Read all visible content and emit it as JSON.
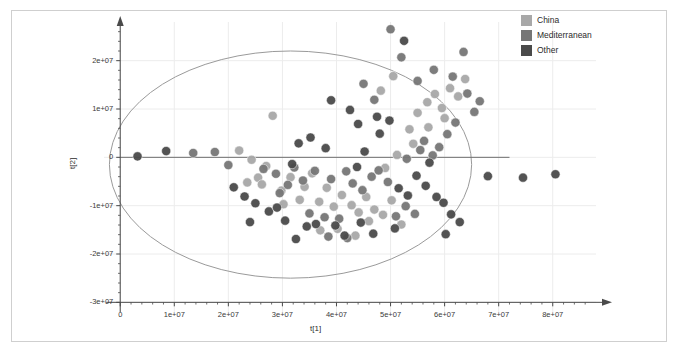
{
  "chart_data": {
    "type": "scatter",
    "title": "",
    "xlabel": "t[1]",
    "ylabel": "t[2]",
    "xlim": [
      -3000000,
      88000000
    ],
    "ylim": [
      -32000000,
      28000000
    ],
    "xticks": [
      0,
      10000000,
      20000000,
      30000000,
      40000000,
      50000000,
      60000000,
      70000000,
      80000000
    ],
    "xtick_labels": [
      "0",
      "1e+07",
      "2e+07",
      "3e+07",
      "4e+07",
      "5e+07",
      "6e+07",
      "7e+07",
      "8e+07"
    ],
    "yticks": [
      20000000,
      10000000,
      0,
      -10000000,
      -20000000,
      -30000000
    ],
    "ytick_labels": [
      "2e+07",
      "1e+07",
      "0",
      "-1e+07",
      "-2e+07",
      "-3e+07"
    ],
    "grid": true,
    "legend_position": "top-right",
    "confidence_ellipse": {
      "center_x": 31500000,
      "center_y": -1500000,
      "radius_x": 33500000,
      "radius_y": 23500000,
      "stroke": "#9a9a9a",
      "label": "hotelling-t2-ellipse"
    },
    "zero_line_y": 0,
    "series": [
      {
        "name": "China",
        "color": "#a8a8a8",
        "points": [
          [
            22000000,
            1400000
          ],
          [
            24300000,
            -500000
          ],
          [
            27000000,
            -1800000
          ],
          [
            28200000,
            8600000
          ],
          [
            25500000,
            -4200000
          ],
          [
            23500000,
            -5200000
          ],
          [
            26200000,
            -5600000
          ],
          [
            29800000,
            -6900000
          ],
          [
            31500000,
            -4100000
          ],
          [
            33200000,
            -8800000
          ],
          [
            30200000,
            -9700000
          ],
          [
            35500000,
            -3300000
          ],
          [
            34100000,
            -6100000
          ],
          [
            36800000,
            -9200000
          ],
          [
            38200000,
            -6300000
          ],
          [
            39500000,
            -10200000
          ],
          [
            41000000,
            -7800000
          ],
          [
            42800000,
            -9900000
          ],
          [
            44100000,
            -11400000
          ],
          [
            40200000,
            -14800000
          ],
          [
            37000000,
            -15100000
          ],
          [
            45500000,
            -8200000
          ],
          [
            47000000,
            -10800000
          ],
          [
            48600000,
            -11900000
          ],
          [
            50200000,
            -8900000
          ],
          [
            46000000,
            -13200000
          ],
          [
            52000000,
            -13900000
          ],
          [
            43500000,
            -16200000
          ],
          [
            49000000,
            -2200000
          ],
          [
            51200000,
            500000
          ],
          [
            53500000,
            5800000
          ],
          [
            55000000,
            9200000
          ],
          [
            56800000,
            11400000
          ],
          [
            58200000,
            13100000
          ],
          [
            59500000,
            10200000
          ],
          [
            61000000,
            14300000
          ],
          [
            62500000,
            12600000
          ],
          [
            57000000,
            6200000
          ],
          [
            54200000,
            2800000
          ],
          [
            60000000,
            8100000
          ],
          [
            63800000,
            16200000
          ],
          [
            50500000,
            16800000
          ],
          [
            48200000,
            13800000
          ]
        ]
      },
      {
        "name": "Mediterranean",
        "color": "#767676",
        "points": [
          [
            13500000,
            900000
          ],
          [
            17500000,
            1100000
          ],
          [
            20000000,
            -1600000
          ],
          [
            26500000,
            -2400000
          ],
          [
            28800000,
            -3400000
          ],
          [
            31000000,
            -5700000
          ],
          [
            29500000,
            -7400000
          ],
          [
            33800000,
            -4800000
          ],
          [
            32200000,
            -2100000
          ],
          [
            36000000,
            -2800000
          ],
          [
            35000000,
            -11600000
          ],
          [
            37800000,
            -12400000
          ],
          [
            39000000,
            -4500000
          ],
          [
            41800000,
            -2900000
          ],
          [
            43000000,
            -5400000
          ],
          [
            44800000,
            -6800000
          ],
          [
            46500000,
            -4000000
          ],
          [
            40500000,
            -12700000
          ],
          [
            38500000,
            -16400000
          ],
          [
            42000000,
            -16700000
          ],
          [
            47800000,
            -2700000
          ],
          [
            49500000,
            -5100000
          ],
          [
            51000000,
            -12200000
          ],
          [
            52800000,
            -10100000
          ],
          [
            54500000,
            -11700000
          ],
          [
            53000000,
            -300000
          ],
          [
            55500000,
            1500000
          ],
          [
            56200000,
            3400000
          ],
          [
            57800000,
            400000
          ],
          [
            59000000,
            2100000
          ],
          [
            60500000,
            4800000
          ],
          [
            62000000,
            7200000
          ],
          [
            58000000,
            18100000
          ],
          [
            55000000,
            15800000
          ],
          [
            52000000,
            20700000
          ],
          [
            47000000,
            11900000
          ],
          [
            45000000,
            15200000
          ],
          [
            50000000,
            26500000
          ],
          [
            63500000,
            21800000
          ],
          [
            65500000,
            9400000
          ],
          [
            64200000,
            13200000
          ],
          [
            66500000,
            11600000
          ],
          [
            61500000,
            16700000
          ]
        ]
      },
      {
        "name": "Other",
        "color": "#4a4a4a",
        "points": [
          [
            3200000,
            200000
          ],
          [
            8500000,
            1300000
          ],
          [
            21000000,
            -6200000
          ],
          [
            23000000,
            -8100000
          ],
          [
            25000000,
            -9500000
          ],
          [
            27500000,
            -11200000
          ],
          [
            24000000,
            -13400000
          ],
          [
            29000000,
            -10400000
          ],
          [
            30500000,
            -13100000
          ],
          [
            31800000,
            -1400000
          ],
          [
            33000000,
            2900000
          ],
          [
            34500000,
            -14300000
          ],
          [
            32500000,
            -16900000
          ],
          [
            36200000,
            -13800000
          ],
          [
            38000000,
            1900000
          ],
          [
            35200000,
            4100000
          ],
          [
            39800000,
            -14100000
          ],
          [
            41500000,
            -16200000
          ],
          [
            43800000,
            -2000000
          ],
          [
            45200000,
            1200000
          ],
          [
            44500000,
            -13500000
          ],
          [
            46800000,
            -15800000
          ],
          [
            48000000,
            4900000
          ],
          [
            49800000,
            7600000
          ],
          [
            51500000,
            -6400000
          ],
          [
            53200000,
            -7900000
          ],
          [
            50800000,
            -14700000
          ],
          [
            54800000,
            -3800000
          ],
          [
            56500000,
            -5900000
          ],
          [
            58500000,
            -8200000
          ],
          [
            57200000,
            -1100000
          ],
          [
            59800000,
            -9400000
          ],
          [
            61200000,
            -11800000
          ],
          [
            60200000,
            -15900000
          ],
          [
            52500000,
            24100000
          ],
          [
            62800000,
            -13400000
          ],
          [
            68000000,
            -3900000
          ],
          [
            74500000,
            -4200000
          ],
          [
            80500000,
            -3500000
          ],
          [
            42500000,
            9800000
          ],
          [
            44000000,
            6900000
          ],
          [
            39000000,
            11800000
          ],
          [
            47500000,
            8400000
          ]
        ]
      }
    ]
  },
  "legend": {
    "items": [
      {
        "label": "China",
        "color": "#a8a8a8"
      },
      {
        "label": "Mediterranean",
        "color": "#767676"
      },
      {
        "label": "Other",
        "color": "#4a4a4a"
      }
    ]
  },
  "axes": {
    "x_title": "t[1]",
    "y_title": "t[2]",
    "x_tick_labels": [
      "0",
      "1e+07",
      "2e+07",
      "3e+07",
      "4e+07",
      "5e+07",
      "6e+07",
      "7e+07",
      "8e+07"
    ],
    "y_tick_labels": [
      "2e+07",
      "1e+07",
      "0",
      "-1e+07",
      "-2e+07",
      "-3e+07"
    ]
  },
  "colors": {
    "frame": "#cfcfcf",
    "axis": "#4a4a4a",
    "grid": "#ececec",
    "ellipse": "#9a9a9a",
    "zero_line": "#6e6e6e"
  }
}
